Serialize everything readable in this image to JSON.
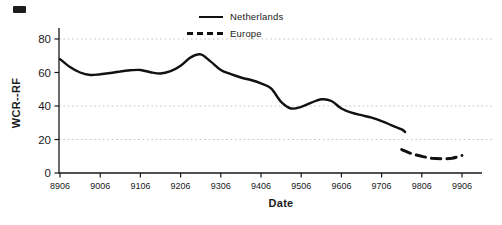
{
  "chart_data": {
    "type": "line",
    "title": "",
    "xlabel": "Date",
    "ylabel": "WCR--RF",
    "x_tick_labels": [
      "8906",
      "9006",
      "9106",
      "9206",
      "9306",
      "9406",
      "9506",
      "9606",
      "9706",
      "9806",
      "9906"
    ],
    "y_tick_values": [
      0,
      20,
      40,
      60,
      80
    ],
    "ylim": [
      0,
      80
    ],
    "gridline_values": [
      20,
      40,
      80
    ],
    "grid_style": "dotted",
    "legend_position": "top-center",
    "colors": {
      "line": "#111111",
      "gridline": "#c3c3c3",
      "axis": "#1a1a1a"
    },
    "series": [
      {
        "name": "Netherlands",
        "line_style": "solid",
        "points": [
          [
            8906,
            68.0
          ],
          [
            8909,
            63.2
          ],
          [
            8912,
            60.0
          ],
          [
            9003,
            58.5
          ],
          [
            9006,
            59.0
          ],
          [
            9009,
            59.7
          ],
          [
            9012,
            60.6
          ],
          [
            9103,
            61.3
          ],
          [
            9106,
            61.5
          ],
          [
            9109,
            60.2
          ],
          [
            9112,
            59.4
          ],
          [
            9203,
            60.8
          ],
          [
            9206,
            64.0
          ],
          [
            9209,
            69.0
          ],
          [
            9212,
            70.8
          ],
          [
            9303,
            66.5
          ],
          [
            9306,
            61.5
          ],
          [
            9309,
            59.0
          ],
          [
            9312,
            57.0
          ],
          [
            9403,
            55.5
          ],
          [
            9406,
            53.5
          ],
          [
            9409,
            50.5
          ],
          [
            9412,
            42.5
          ],
          [
            9503,
            38.5
          ],
          [
            9506,
            39.5
          ],
          [
            9509,
            42.0
          ],
          [
            9512,
            44.0
          ],
          [
            9603,
            43.0
          ],
          [
            9606,
            38.5
          ],
          [
            9609,
            36.0
          ],
          [
            9612,
            34.5
          ],
          [
            9703,
            33.0
          ],
          [
            9706,
            31.0
          ],
          [
            9709,
            28.5
          ],
          [
            9712,
            26.0
          ],
          [
            9801,
            24.5
          ]
        ]
      },
      {
        "name": "Europe",
        "line_style": "dashed",
        "points": [
          [
            9712,
            14.0
          ],
          [
            9803,
            11.5
          ],
          [
            9806,
            10.0
          ],
          [
            9809,
            8.8
          ],
          [
            9812,
            8.5
          ],
          [
            9903,
            8.8
          ],
          [
            9906,
            10.5
          ]
        ]
      }
    ]
  }
}
